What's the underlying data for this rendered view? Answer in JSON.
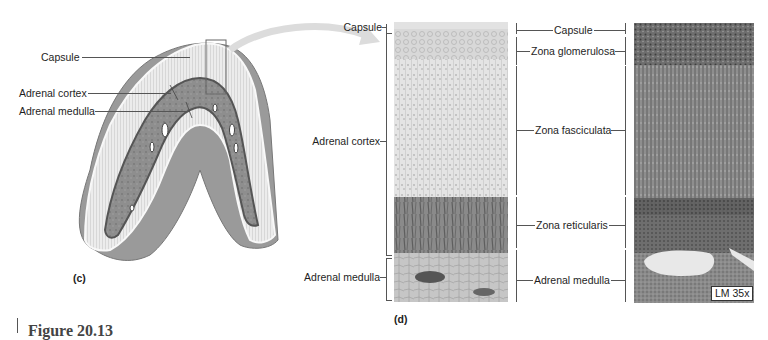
{
  "panel_c": {
    "letter": "(c)",
    "labels": {
      "capsule": "Capsule",
      "adrenal_cortex": "Adrenal cortex",
      "adrenal_medulla": "Adrenal medulla"
    }
  },
  "panel_d": {
    "letter": "(d)",
    "left_labels": {
      "capsule": "Capsule",
      "adrenal_cortex": "Adrenal cortex",
      "adrenal_medulla": "Adrenal medulla"
    },
    "zone_labels": [
      {
        "id": "capsule",
        "label": "Capsule"
      },
      {
        "id": "zona_glomerulosa",
        "label": "Zona glomerulosa"
      },
      {
        "id": "zona_fasciculata",
        "label": "Zona fasciculata"
      },
      {
        "id": "zona_reticularis",
        "label": "Zona reticularis"
      },
      {
        "id": "adrenal_medulla",
        "label": "Adrenal medulla"
      }
    ]
  },
  "micrograph": {
    "magnification": "LM 35x"
  },
  "figure_caption": {
    "label": "Figure 20.13"
  },
  "colors": {
    "cortex_light": "#e6e6e6",
    "medulla_gray": "#8c8c8c",
    "outline": "#555555",
    "background": "#ffffff"
  }
}
